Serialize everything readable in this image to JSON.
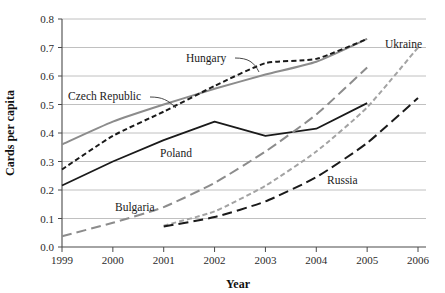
{
  "chart_data": {
    "type": "line",
    "title": "",
    "xlabel": "Year",
    "ylabel": "Cards per capita",
    "x": [
      1999,
      2000,
      2001,
      2002,
      2003,
      2004,
      2005,
      2006
    ],
    "xlim": [
      1999,
      2006
    ],
    "ylim": [
      0.0,
      0.8
    ],
    "ytick_labels": [
      "0.0",
      "0.1",
      "0.2",
      "0.3",
      "0.4",
      "0.5",
      "0.6",
      "0.7",
      "0.8"
    ],
    "ytick_values": [
      0.0,
      0.1,
      0.2,
      0.3,
      0.4,
      0.5,
      0.6,
      0.7,
      0.8
    ],
    "xtick_labels": [
      "1999",
      "2000",
      "2001",
      "2002",
      "2003",
      "2004",
      "2005",
      "2006"
    ],
    "grid": "horizontal",
    "legend_position": "inline-annotations",
    "series": [
      {
        "name": "Czech Republic",
        "style": "solid",
        "color": "#8c8c8c",
        "width": 2.0,
        "x": [
          1999,
          2000,
          2001,
          2002,
          2003,
          2004,
          2005
        ],
        "values": [
          0.36,
          0.44,
          0.5,
          0.555,
          0.605,
          0.65,
          0.73
        ]
      },
      {
        "name": "Hungary",
        "style": "short-dash",
        "color": "#1a1a1a",
        "width": 2.0,
        "x": [
          1999,
          2000,
          2001,
          2002,
          2003,
          2004,
          2005
        ],
        "values": [
          0.272,
          0.39,
          0.475,
          0.565,
          0.645,
          0.66,
          0.73
        ]
      },
      {
        "name": "Poland",
        "style": "solid",
        "color": "#1a1a1a",
        "width": 1.8,
        "x": [
          1999,
          2000,
          2001,
          2002,
          2003,
          2004,
          2005
        ],
        "values": [
          0.216,
          0.3,
          0.375,
          0.44,
          0.39,
          0.415,
          0.505
        ]
      },
      {
        "name": "Bulgaria",
        "style": "long-dash",
        "color": "#8c8c8c",
        "width": 2.0,
        "x": [
          1999,
          2000,
          2001,
          2002,
          2003,
          2004,
          2005
        ],
        "values": [
          0.038,
          0.085,
          0.14,
          0.225,
          0.335,
          0.465,
          0.63
        ]
      },
      {
        "name": "Ukraine",
        "style": "short-dash",
        "color": "#a3a3a3",
        "width": 2.0,
        "x": [
          2001,
          2002,
          2003,
          2004,
          2005,
          2006
        ],
        "values": [
          0.075,
          0.125,
          0.215,
          0.335,
          0.49,
          0.7
        ]
      },
      {
        "name": "Russia",
        "style": "long-dash",
        "color": "#1a1a1a",
        "width": 2.0,
        "x": [
          2001,
          2002,
          2003,
          2004,
          2005,
          2006
        ],
        "values": [
          0.072,
          0.105,
          0.16,
          0.245,
          0.365,
          0.523
        ]
      }
    ],
    "annotations": [
      {
        "text": "Czech Republic",
        "series": "Czech Republic"
      },
      {
        "text": "Hungary",
        "series": "Hungary"
      },
      {
        "text": "Poland",
        "series": "Poland"
      },
      {
        "text": "Bulgaria",
        "series": "Bulgaria"
      },
      {
        "text": "Ukraine",
        "series": "Ukraine"
      },
      {
        "text": "Russia",
        "series": "Russia"
      }
    ]
  }
}
